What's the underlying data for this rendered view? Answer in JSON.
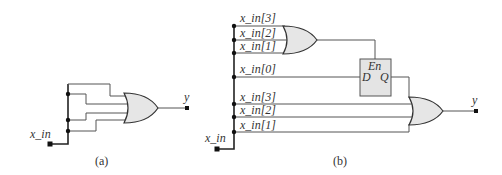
{
  "figure": {
    "part_a": {
      "caption": "(a)",
      "input_label": "x_in",
      "output_label": "y"
    },
    "part_b": {
      "caption": "(b)",
      "input_label": "x_in",
      "output_label": "y",
      "upper_or_inputs": [
        "x_in[3]",
        "x_in[2]",
        "x_in[1]"
      ],
      "latch_input_label": "x_in[0]",
      "latch": {
        "enable_label": "En",
        "d_label": "D",
        "q_label": "Q"
      },
      "lower_or_inputs": [
        "x_in[3]",
        "x_in[2]",
        "x_in[1]"
      ]
    }
  }
}
